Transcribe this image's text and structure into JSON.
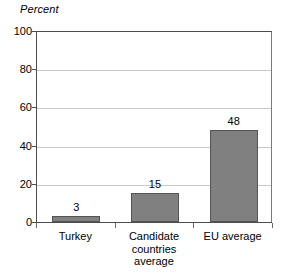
{
  "chart_data": {
    "type": "bar",
    "title": "",
    "subtitle": "",
    "xlabel": "",
    "ylabel": "Percent",
    "ylim": [
      0,
      100
    ],
    "yticks": [
      0,
      20,
      40,
      60,
      80,
      100
    ],
    "ytick_labels": [
      "0",
      "20",
      "40",
      "60",
      "80",
      "100"
    ],
    "grid": true,
    "legend": null,
    "categories": [
      "Turkey",
      "Candidate countries average",
      "EU average"
    ],
    "category_lines": [
      [
        "Turkey"
      ],
      [
        "Candidate",
        "countries",
        "average"
      ],
      [
        "EU average"
      ]
    ],
    "values": [
      3,
      15,
      48
    ],
    "value_labels": [
      "3",
      "15",
      "48"
    ],
    "colors": {
      "bar_fill": "#808080",
      "bar_border": "#545454",
      "gridline": "#c9c9c9",
      "axis": "#4d4d4d",
      "text": "#000000",
      "background": "#ffffff"
    }
  }
}
